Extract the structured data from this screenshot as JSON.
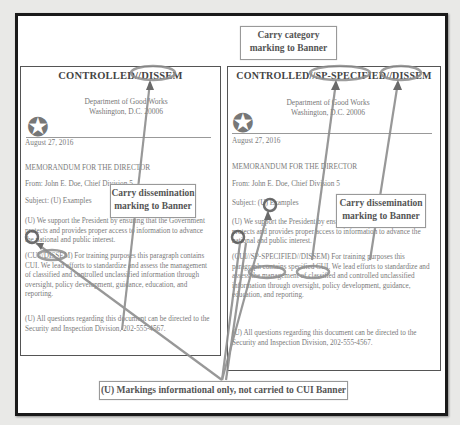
{
  "callouts": {
    "category": "Carry category marking to Banner",
    "category_line1": "Carry category",
    "category_line2": "marking to Banner",
    "dissem_left_line1": "Carry dissemination",
    "dissem_left_line2": "marking to Banner",
    "dissem_right_line1": "Carry dissemination",
    "dissem_right_line2": "marking to Banner",
    "bottom": "(U) Markings informational only, not carried to CUI Banner"
  },
  "left_doc": {
    "banner": "CONTROLLED//DISSEM",
    "dept_line1": "Department of Good Works",
    "dept_line2": "Washington, D.C. 20006",
    "date": "August 27, 2016",
    "memo": "MEMORANDUM FOR THE DIRECTOR",
    "from": "From:  John E. Doe, Chief Division 5",
    "subject": "Subject:  (U) Examples",
    "para1": "(U) We support the President by ensuring that the Government protects and provides proper access to information to advance the national and public interest.",
    "para2": "(CUI//DISSEM) For training purposes this paragraph contains CUI. We lead efforts to standardize and assess the management of classified and controlled unclassified information through oversight, policy development, guidance, education, and reporting.",
    "para3": "(U) All questions regarding this document can be directed to the Security and Inspection Division, 202-555-4567."
  },
  "right_doc": {
    "banner": "CONTROLLED//SP-SPECIFIED//DISSEM",
    "dept_line1": "Department of Good Works",
    "dept_line2": "Washington, D.C. 20006",
    "date": "August 27, 2016",
    "memo": "MEMORANDUM FOR THE DIRECTOR",
    "from": "From:  John E. Doe, Chief Division 5",
    "subject": "Subject: (U) Examples",
    "para1": "(U) We support the President by ensuring that the Government protects and provides proper access to information to advance the national and public interest.",
    "para2": "(CUI//SP-SPECIFIED//DISSEM) For training purposes this paragraph contains specified CUI. We lead efforts to standardize and assess the management of classified and controlled unclassified information through oversight, policy development, guidance, education, and reporting.",
    "para3": "(U) All questions regarding this document can be directed to the Security and Inspection Division, 202-555-4567."
  },
  "icons": {
    "seal": "star-seal-icon",
    "star_glyph": "✪"
  },
  "colors": {
    "frame": "#1a1a1a",
    "annotation": "#8a8a8a",
    "text": "#7a7a7a"
  }
}
